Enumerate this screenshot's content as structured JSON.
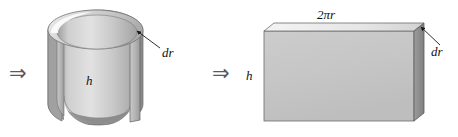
{
  "figure": {
    "background_color": "#ffffff",
    "width": 458,
    "height": 137,
    "panels": [
      {
        "name": "cylindrical-shell",
        "implication_arrow": "⇒",
        "labels": [
          {
            "name": "shell-thickness",
            "text": "dr"
          },
          {
            "name": "shell-height",
            "text": "h"
          }
        ]
      },
      {
        "name": "unrolled-slab",
        "implication_arrow": "⇒",
        "labels": [
          {
            "name": "slab-width",
            "text": "2πr"
          },
          {
            "name": "slab-thickness",
            "text": "dr"
          },
          {
            "name": "slab-height",
            "text": "h"
          }
        ]
      }
    ],
    "colors": {
      "face_light": "#d8d8d8",
      "face_mid": "#c6c6c6",
      "face_dark": "#a9a9a9",
      "face_darkest": "#8e8e8e",
      "highlight": "#f2f2f2",
      "outline": "#5c5c5c",
      "leader_line": "#1a1a1a",
      "text": "#111111"
    }
  }
}
